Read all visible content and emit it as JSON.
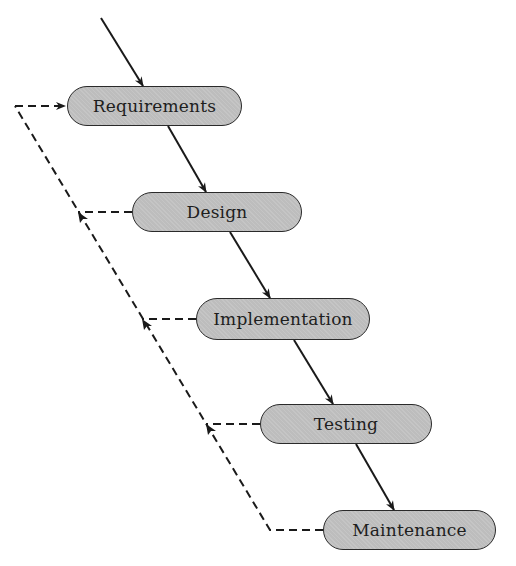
{
  "diagram": {
    "type": "waterfall-model",
    "stages": [
      {
        "label": "Requirements"
      },
      {
        "label": "Design"
      },
      {
        "label": "Implementation"
      },
      {
        "label": "Testing"
      },
      {
        "label": "Maintenance"
      }
    ],
    "flow": "solid arrows descend from each stage to the next",
    "feedback": "dashed lines from each later stage return to the previous stages, ending with an arrow into Requirements",
    "colors": {
      "box_fill": "#bdbdbd",
      "box_border": "#2a2a2a",
      "line": "#1a1a1a"
    }
  }
}
